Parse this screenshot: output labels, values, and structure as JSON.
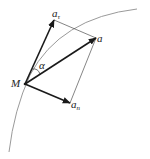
{
  "diagram": {
    "title": "",
    "point": {
      "label": "M",
      "x": 25,
      "y": 84
    },
    "vectors": [
      {
        "id": "a_tau",
        "label": "a",
        "subscript": "τ",
        "tip": {
          "x": 54,
          "y": 20
        }
      },
      {
        "id": "a",
        "label": "a",
        "subscript": "",
        "tip": {
          "x": 96,
          "y": 38
        }
      },
      {
        "id": "a_n",
        "label": "a",
        "subscript": "n",
        "tip": {
          "x": 70,
          "y": 103
        }
      }
    ],
    "angle": {
      "label": "α",
      "between": [
        "a_tau",
        "a"
      ]
    },
    "curve": {
      "type": "arc",
      "color": "#999999"
    },
    "colors": {
      "vector": "#1a1a1a",
      "guide": "#333333",
      "curve": "#999999"
    }
  }
}
